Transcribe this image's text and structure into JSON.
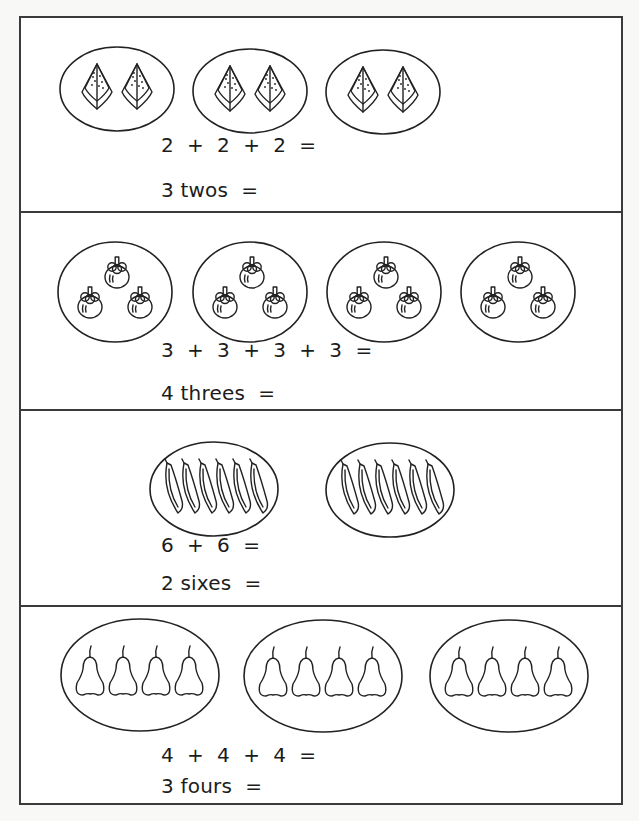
{
  "worksheet": {
    "sections": [
      {
        "fruit": "watermelon-slice",
        "groups": 3,
        "items_per_group": 2,
        "addition": "2  +  2  +  2  =",
        "multiplication": "3 twos  ="
      },
      {
        "fruit": "mangosteen",
        "groups": 4,
        "items_per_group": 3,
        "addition": "3  +  3  +  3  +  3  =",
        "multiplication": "4 threes  ="
      },
      {
        "fruit": "banana",
        "groups": 2,
        "items_per_group": 6,
        "addition": "6  +  6  =",
        "multiplication": "2 sixes  ="
      },
      {
        "fruit": "pear",
        "groups": 3,
        "items_per_group": 4,
        "addition": "4  +  4  +  4  =",
        "multiplication": "3 fours  ="
      }
    ]
  }
}
